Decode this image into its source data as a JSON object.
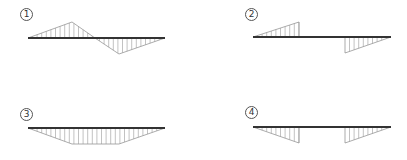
{
  "labels": [
    {
      "id": 1,
      "text": "1",
      "x": 20,
      "y": 8
    },
    {
      "id": 2,
      "text": "2",
      "x": 245,
      "y": 8
    },
    {
      "id": 3,
      "text": "3",
      "x": 20,
      "y": 108
    },
    {
      "id": 4,
      "text": "4",
      "x": 245,
      "y": 106
    }
  ],
  "colors": {
    "baseline": "#333333",
    "hatch": "#999999",
    "outline": "#888888"
  },
  "diagrams": [
    {
      "id": 1,
      "baseline": {
        "x1": 28,
        "x2": 165,
        "y": 38
      },
      "polygons": [
        [
          [
            28,
            38
          ],
          [
            72,
            22
          ],
          [
            95,
            38
          ]
        ],
        [
          [
            95,
            38
          ],
          [
            119,
            54
          ],
          [
            165,
            38
          ]
        ]
      ]
    },
    {
      "id": 2,
      "baseline": {
        "x1": 253,
        "x2": 391,
        "y": 37
      },
      "polygons": [
        [
          [
            253,
            37
          ],
          [
            299,
            22
          ],
          [
            299,
            37
          ]
        ],
        [
          [
            345,
            37
          ],
          [
            345,
            53
          ],
          [
            391,
            37
          ]
        ]
      ]
    },
    {
      "id": 3,
      "baseline": {
        "x1": 28,
        "x2": 165,
        "y": 128
      },
      "polygons": [
        [
          [
            28,
            128
          ],
          [
            72,
            144
          ],
          [
            119,
            144
          ],
          [
            165,
            128
          ]
        ]
      ]
    },
    {
      "id": 4,
      "baseline": {
        "x1": 253,
        "x2": 391,
        "y": 127
      },
      "polygons": [
        [
          [
            253,
            127
          ],
          [
            299,
            143
          ],
          [
            299,
            127
          ]
        ],
        [
          [
            345,
            127
          ],
          [
            345,
            143
          ],
          [
            391,
            127
          ]
        ]
      ]
    }
  ]
}
